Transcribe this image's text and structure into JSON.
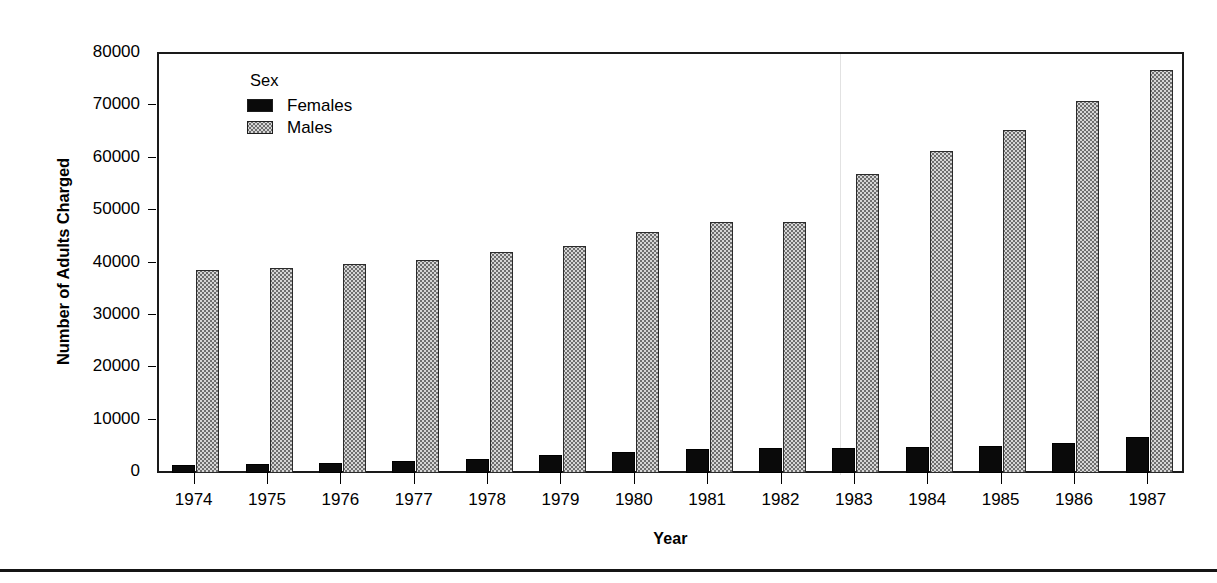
{
  "chart_data": {
    "type": "bar",
    "title": "",
    "xlabel": "Year",
    "ylabel": "Number of Adults Charged",
    "categories": [
      "1974",
      "1975",
      "1976",
      "1977",
      "1978",
      "1979",
      "1980",
      "1981",
      "1982",
      "1983",
      "1984",
      "1985",
      "1986",
      "1987"
    ],
    "series": [
      {
        "name": "Females",
        "color": "#0a0a0a",
        "values": [
          1600,
          1700,
          1900,
          2200,
          2700,
          3400,
          4100,
          4600,
          4800,
          4800,
          4900,
          5200,
          5800,
          6800
        ]
      },
      {
        "name": "Males",
        "color": "#d6d6d6",
        "values": [
          38700,
          39200,
          39900,
          40700,
          42200,
          43300,
          46000,
          48000,
          48000,
          57000,
          61500,
          65500,
          71000,
          77000
        ]
      }
    ],
    "ylim": [
      0,
      80000
    ],
    "yticks": [
      0,
      10000,
      20000,
      30000,
      40000,
      50000,
      60000,
      70000,
      80000
    ],
    "ytick_labels": [
      "0",
      "10000",
      "20000",
      "30000",
      "40000",
      "50000",
      "60000",
      "70000",
      "80000"
    ],
    "grid": false,
    "legend_position": "inside-top-left"
  },
  "legend": {
    "title": "Sex",
    "entries": [
      {
        "label": "Females",
        "swatch": "solid-black"
      },
      {
        "label": "Males",
        "swatch": "stippled-gray"
      }
    ]
  },
  "axes": {
    "y_title": "Number of Adults Charged",
    "x_title": "Year"
  }
}
